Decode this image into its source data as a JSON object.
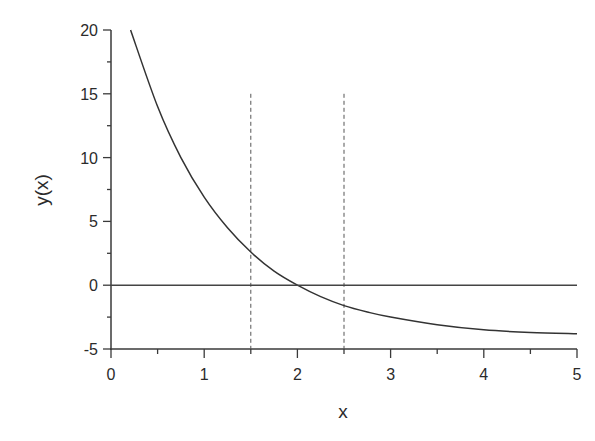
{
  "chart_data": {
    "type": "line",
    "title": "",
    "xlabel": "x",
    "ylabel": "y(x)",
    "xlim": [
      0,
      5
    ],
    "ylim": [
      -5,
      20
    ],
    "x_ticks": [
      "0",
      "1",
      "2",
      "3",
      "4",
      "5"
    ],
    "y_ticks": [
      "-5",
      "0",
      "5",
      "10",
      "15",
      "20"
    ],
    "grid": false,
    "legend": null,
    "series": [
      {
        "name": "y(x)",
        "style": "solid",
        "x": [
          0.21,
          0.5,
          0.75,
          1.0,
          1.25,
          1.5,
          1.75,
          2.0,
          2.25,
          2.5,
          2.75,
          3.0,
          3.5,
          4.0,
          4.5,
          5.0
        ],
        "values": [
          20.0,
          14.0,
          10.0,
          6.9,
          4.5,
          2.6,
          1.1,
          0.0,
          -0.9,
          -1.6,
          -2.1,
          -2.5,
          -3.1,
          -3.5,
          -3.7,
          -3.8
        ]
      },
      {
        "name": "zero line",
        "style": "solid",
        "x": [
          0,
          5
        ],
        "values": [
          0,
          0
        ]
      }
    ],
    "annotations": [
      {
        "type": "vertical-dashed-line",
        "x": 1.5,
        "y_from": -5,
        "y_to": 15
      },
      {
        "type": "vertical-dashed-line",
        "x": 2.5,
        "y_from": -5,
        "y_to": 15
      }
    ]
  },
  "axes": {
    "x_label": "x",
    "y_label": "y(x)",
    "x_tick_labels": [
      "0",
      "1",
      "2",
      "3",
      "4",
      "5"
    ],
    "y_tick_labels": [
      "20",
      "15",
      "10",
      "5",
      "0",
      "-5"
    ]
  }
}
